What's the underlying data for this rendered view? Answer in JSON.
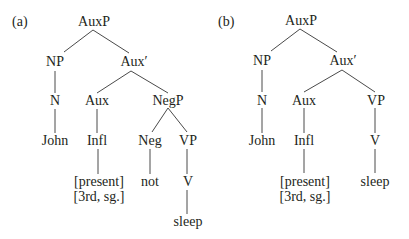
{
  "tree_a": {
    "panel_label": "(a)",
    "nodes": {
      "auxp": "AuxP",
      "np": "NP",
      "auxbar": "Aux′",
      "n": "N",
      "aux": "Aux",
      "negp": "NegP",
      "john": "John",
      "infl": "Infl",
      "neg": "Neg",
      "vp": "VP",
      "present": "[present]",
      "person_number": "[3rd, sg.]",
      "not": "not",
      "v": "V",
      "sleep": "sleep"
    },
    "edges": [
      [
        "AuxP",
        "NP"
      ],
      [
        "AuxP",
        "Aux′"
      ],
      [
        "NP",
        "N"
      ],
      [
        "N",
        "John"
      ],
      [
        "Aux′",
        "Aux"
      ],
      [
        "Aux′",
        "NegP"
      ],
      [
        "Aux",
        "Infl"
      ],
      [
        "Infl",
        "[present] [3rd, sg.]"
      ],
      [
        "NegP",
        "Neg"
      ],
      [
        "NegP",
        "VP"
      ],
      [
        "Neg",
        "not"
      ],
      [
        "VP",
        "V"
      ],
      [
        "V",
        "sleep"
      ]
    ]
  },
  "tree_b": {
    "panel_label": "(b)",
    "nodes": {
      "auxp": "AuxP",
      "np": "NP",
      "auxbar": "Aux′",
      "n": "N",
      "aux": "Aux",
      "vp": "VP",
      "john": "John",
      "infl": "Infl",
      "v": "V",
      "present": "[present]",
      "person_number": "[3rd, sg.]",
      "sleep": "sleep"
    },
    "edges": [
      [
        "AuxP",
        "NP"
      ],
      [
        "AuxP",
        "Aux′"
      ],
      [
        "NP",
        "N"
      ],
      [
        "N",
        "John"
      ],
      [
        "Aux′",
        "Aux"
      ],
      [
        "Aux′",
        "VP"
      ],
      [
        "Aux",
        "Infl"
      ],
      [
        "Infl",
        "[present] [3rd, sg.]"
      ],
      [
        "VP",
        "V"
      ],
      [
        "V",
        "sleep"
      ]
    ]
  },
  "colors": {
    "text": "#231f20",
    "edge": "#4a4a4a",
    "background": "#ffffff"
  }
}
